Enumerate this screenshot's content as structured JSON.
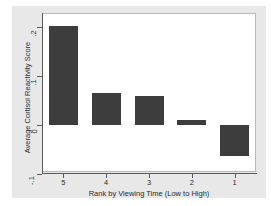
{
  "chart_data": {
    "type": "bar",
    "title": "",
    "subtitle": "",
    "xlabel": "Rank by Viewing Time (Low to High)",
    "ylabel": "Average Cortisol Reactivity Score",
    "categories": [
      "5",
      "4",
      "3",
      "2",
      "1"
    ],
    "values": [
      0.202,
      0.065,
      0.058,
      0.01,
      -0.062
    ],
    "series": [
      {
        "name": "Average Cortisol Reactivity Score",
        "values": [
          0.202,
          0.065,
          0.058,
          0.01,
          -0.062
        ]
      }
    ],
    "ylim": [
      -0.1,
      0.21
    ],
    "yticks": [
      0.2,
      0.1,
      0,
      -0.1
    ],
    "ytick_labels": [
      ".2",
      ".1",
      "0",
      "-.1"
    ],
    "xticks": [
      "5",
      "4",
      "3",
      "2",
      "1"
    ],
    "grid": false,
    "legend": false,
    "legend_position": "none",
    "bar_color": "#3d3d3d",
    "plot_background": "#ffffff",
    "graph_background": "#e8e8e8",
    "axis_color": "#5a5a5a"
  }
}
